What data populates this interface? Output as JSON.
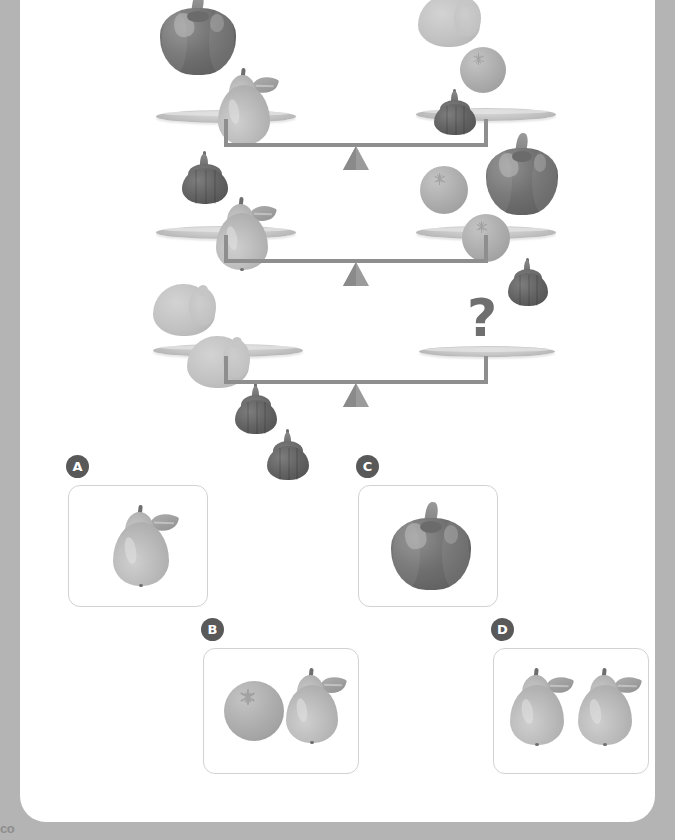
{
  "page": {
    "type": "visual-logic-puzzle",
    "footer_text": "co",
    "background_color": "#b4b4b4",
    "card_color": "#ffffff"
  },
  "puzzle": {
    "question_mark": "?",
    "equations": [
      {
        "id": "row-1",
        "left_pan": [
          "pepper",
          "pear"
        ],
        "right_pan": [
          "melon",
          "onion",
          "orange",
          "pepper"
        ]
      },
      {
        "id": "row-2",
        "left_pan": [
          "onion",
          "pear"
        ],
        "right_pan": [
          "orange",
          "orange",
          "onion"
        ]
      },
      {
        "id": "row-3",
        "left_pan": [
          "pear",
          "pear",
          "onion",
          "onion"
        ],
        "right_pan": [
          "question"
        ]
      }
    ]
  },
  "options": [
    {
      "id": "A",
      "label": "A",
      "contents": [
        "pear"
      ]
    },
    {
      "id": "B",
      "label": "B",
      "contents": [
        "orange",
        "pear"
      ]
    },
    {
      "id": "C",
      "label": "C",
      "contents": [
        "pepper"
      ]
    },
    {
      "id": "D",
      "label": "D",
      "contents": [
        "pear",
        "pear"
      ]
    }
  ],
  "colors": {
    "pepper": "#6f6f6f",
    "pear": "#b9b9b9",
    "onion": "#5e5e5e",
    "orange": "#aeaeae",
    "melon": "#c6c6c6",
    "beam": "#8e8e8e",
    "fulcrum": "#9b9b9b",
    "badge": "#595959",
    "card_border": "#d2d2d2"
  }
}
